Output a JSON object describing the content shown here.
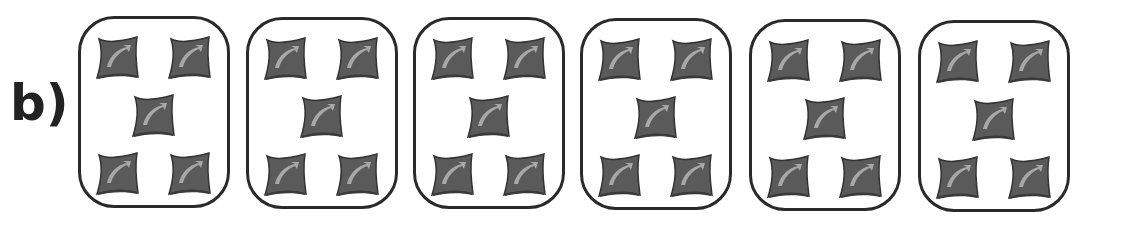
{
  "label": "b)",
  "groups": [
    {
      "count": 5,
      "item": "bag-icon"
    },
    {
      "count": 5,
      "item": "bag-icon"
    },
    {
      "count": 5,
      "item": "bag-icon"
    },
    {
      "count": 5,
      "item": "bag-icon"
    },
    {
      "count": 5,
      "item": "bag-icon"
    },
    {
      "count": 5,
      "item": "bag-icon"
    }
  ],
  "colors": {
    "bag_fill": "#5a5a5a",
    "bag_highlight": "#a8a8a8",
    "border": "#2a2a2a",
    "text": "#222222"
  }
}
